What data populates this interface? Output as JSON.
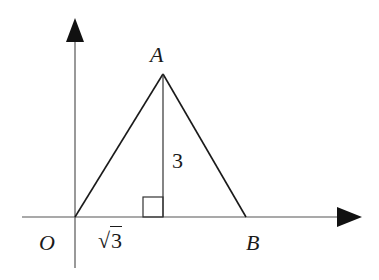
{
  "diagram": {
    "type": "coordinate-geometry",
    "colors": {
      "stroke": "#1a1a1a",
      "axis": "#555555",
      "background": "#ffffff"
    },
    "labels": {
      "origin": "O",
      "apex": "A",
      "right_vertex": "B",
      "foot_distance": "3",
      "foot_distance_prefix": "√",
      "height": "3"
    },
    "geometry": {
      "O": [
        0,
        0
      ],
      "A": [
        "√3",
        3
      ],
      "B": [
        "2√3",
        0
      ],
      "altitude_foot": [
        "√3",
        0
      ],
      "right_angle_at": "altitude_foot"
    }
  }
}
